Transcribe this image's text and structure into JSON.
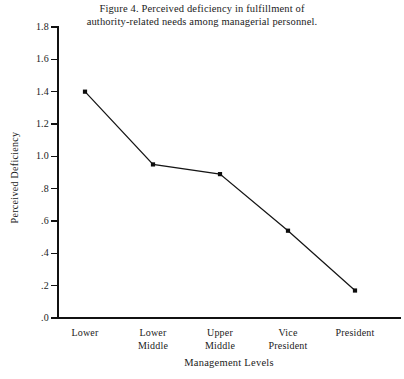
{
  "figure": {
    "title_line1": "Figure 4. Perceived deficiency in fulfillment of",
    "title_line2": "authority-related needs among managerial personnel."
  },
  "chart_data": {
    "type": "line",
    "title": "Figure 4. Perceived deficiency in fulfillment of authority-related needs among managerial personnel.",
    "xlabel": "Management Levels",
    "ylabel": "Perceived Deficiency",
    "categories": [
      "Lower",
      "Lower Middle",
      "Upper Middle",
      "Vice President",
      "President"
    ],
    "category_lines": [
      [
        "Lower"
      ],
      [
        "Lower",
        "Middle"
      ],
      [
        "Upper",
        "Middle"
      ],
      [
        "Vice",
        "President"
      ],
      [
        "President"
      ]
    ],
    "values": [
      1.4,
      0.95,
      0.89,
      0.54,
      0.17
    ],
    "ylim": [
      0.0,
      1.8
    ],
    "ytick_values": [
      0.0,
      0.2,
      0.4,
      0.6,
      0.8,
      1.0,
      1.2,
      1.4,
      1.6,
      1.8
    ],
    "ytick_labels": [
      ".0",
      ".2",
      ".4",
      ".6",
      ".8",
      "1.0",
      "1.2",
      "1.4",
      "1.6",
      "1.8"
    ],
    "grid": false,
    "legend": false,
    "marker": "square",
    "series_color": "#111111",
    "background_color": "#ffffff"
  },
  "geometry": {
    "x_origin": 57,
    "x_right": 400,
    "y_baseline": 318,
    "y_top": 27,
    "x_positions": [
      85,
      153,
      220,
      288,
      355
    ]
  }
}
